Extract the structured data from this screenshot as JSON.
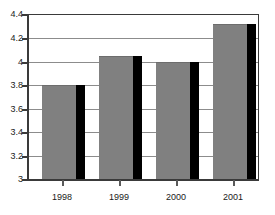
{
  "chart_data": {
    "type": "bar",
    "title": "",
    "subtitle": "",
    "xlabel": "",
    "ylabel": "",
    "categories": [
      "1998",
      "1999",
      "2000",
      "2001"
    ],
    "values": [
      3.8,
      4.05,
      4.0,
      4.32
    ],
    "series": [
      {
        "name": "",
        "values": [
          3.8,
          4.05,
          4.0,
          4.32
        ]
      }
    ],
    "ylim": [
      3,
      4.4
    ],
    "y_ticks": [
      3,
      3.2,
      3.4,
      3.6,
      3.8,
      4,
      4.2,
      4.4
    ],
    "y_tick_labels": [
      "3",
      "3.2",
      "3.4",
      "3.6",
      "3.8",
      "4",
      "4.2",
      "4.4"
    ],
    "grid": true,
    "grid_axis": "y",
    "legend": false,
    "legend_position": "none",
    "bar_color": "#808080",
    "bar_shadow_color": "#000000",
    "grid_color": "#8c8c8c",
    "axis_color": "#3a3a3a",
    "background_color": "#ffffff",
    "text_color": "#1a1a1a",
    "annotations": []
  }
}
